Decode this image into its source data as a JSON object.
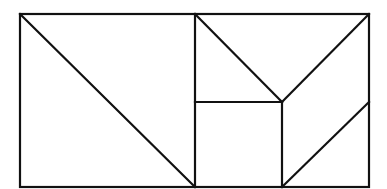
{
  "diagram": {
    "type": "geometric-dissection",
    "stroke_color": "#111111",
    "stroke_width": 2.2,
    "background": "#ffffff",
    "outer_rectangle": {
      "x1": 20,
      "y1": 14,
      "x2": 369,
      "y2": 187
    },
    "segments": [
      {
        "name": "left-square-right-edge",
        "x1": 195,
        "y1": 14,
        "x2": 195,
        "y2": 187
      },
      {
        "name": "left-square-diagonal",
        "x1": 20,
        "y1": 14,
        "x2": 195,
        "y2": 187
      },
      {
        "name": "upper-left-diagonal",
        "x1": 195,
        "y1": 14,
        "x2": 282,
        "y2": 102
      },
      {
        "name": "upper-right-diagonal",
        "x1": 369,
        "y1": 14,
        "x2": 282,
        "y2": 102
      },
      {
        "name": "middle-horizontal",
        "x1": 195,
        "y1": 102,
        "x2": 282,
        "y2": 102
      },
      {
        "name": "middle-vertical",
        "x1": 282,
        "y1": 102,
        "x2": 282,
        "y2": 187
      },
      {
        "name": "lower-right-diagonal",
        "x1": 369,
        "y1": 102,
        "x2": 282,
        "y2": 187
      }
    ]
  }
}
